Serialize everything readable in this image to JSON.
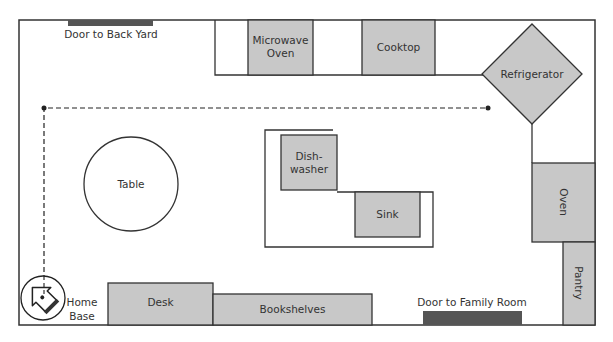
{
  "diagram": {
    "colors": {
      "wall": "#333333",
      "appliance_fill": "#c8c8c8",
      "door_fill": "#555555",
      "background": "#ffffff",
      "path": "#222222"
    },
    "labels": {
      "door_back_yard": "Door to Back Yard",
      "microwave_line1": "Microwave",
      "microwave_line2": "Oven",
      "cooktop": "Cooktop",
      "refrigerator": "Refrigerator",
      "dishwasher_line1": "Dish-",
      "dishwasher_line2": "washer",
      "sink": "Sink",
      "table": "Table",
      "oven": "Oven",
      "pantry": "Pantry",
      "desk": "Desk",
      "bookshelves": "Bookshelves",
      "door_family_room": "Door to Family Room",
      "home_base_line1": "Home",
      "home_base_line2": "Base"
    },
    "icons": {
      "home_base": "robot-vacuum-icon"
    }
  }
}
